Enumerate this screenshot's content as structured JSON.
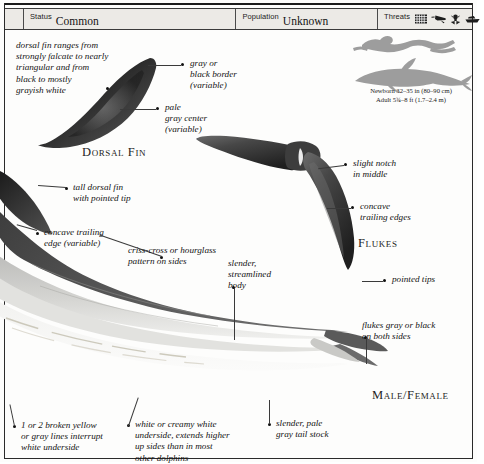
{
  "statusbar": {
    "status": {
      "key": "Status",
      "value": "Common"
    },
    "population": {
      "key": "Population",
      "value": "Unknown"
    },
    "threats": {
      "key": "Threats",
      "icons": [
        "gillnet-icon",
        "harpoon-icon",
        "propeller-strike-icon",
        "boat-icon"
      ]
    }
  },
  "size_panel": {
    "silhouettes": [
      "human-swimmer-silhouette",
      "dolphin-silhouette"
    ],
    "newborn": "Newborn 32–35 in (80–90 cm)",
    "adult": "Adult 5¾–8 ft (1.7–2.4 m)"
  },
  "captions": {
    "dorsal_fin": "Dorsal Fin",
    "flukes": "Flukes",
    "male_female": "Male/Female"
  },
  "annotations": {
    "dorsal_range": "dorsal fin ranges from\nstrongly falcate to nearly\ntriangular and from\nblack to mostly\ngrayish white",
    "gray_black_border": "gray or\nblack border\n(variable)",
    "pale_gray_center": "pale\ngray center\n(variable)",
    "slight_notch": "slight notch\nin middle",
    "concave_trailing_edges": "concave\ntrailing edges",
    "pointed_tips": "pointed tips",
    "tall_dorsal_fin": "tall dorsal fin\nwith pointed tip",
    "concave_trailing_edge_variable": "concave trailing\nedge (variable)",
    "criss_cross": "criss-cross or hourglass\npattern on sides",
    "slender_body": "slender,\nstreamlined\nbody",
    "flukes_gray_black": "flukes gray or black\non both sides",
    "broken_lines": "1 or 2 broken yellow\nor gray lines interrupt\nwhite underside",
    "white_underside": "white or creamy white\nunderside, extends higher\nup sides than in most\nother dolphins",
    "pale_tail_stock": "slender, pale\ngray tail stock"
  },
  "illustrations": {
    "dorsal_fin_detail": "dorsal-fin-illustration",
    "flukes_detail": "flukes-illustration",
    "body_profile": "dolphin-body-illustration"
  },
  "colors": {
    "ink": "#141414",
    "rule": "#2a2a2a",
    "bar_fill": "#eceae6",
    "silhouette": "#9a9a9a",
    "body_dark": "#4a4a4a",
    "body_light": "#d8d8d6"
  }
}
